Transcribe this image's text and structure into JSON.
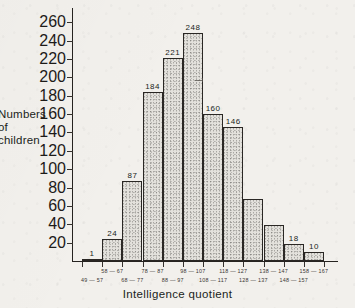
{
  "figure": {
    "y_axis_title": "Numbers\nof\nchildren",
    "y_axis_title_lines": [
      "Numbers",
      "of",
      "children"
    ],
    "x_axis_title": "Intelligence quotient"
  },
  "chart_data": {
    "type": "bar",
    "title": "",
    "xlabel": "Intelligence quotient",
    "ylabel": "Numbers of children",
    "ylim": [
      0,
      270
    ],
    "yticks": [
      20,
      40,
      60,
      80,
      100,
      120,
      140,
      160,
      180,
      200,
      220,
      240,
      260
    ],
    "grid": false,
    "legend": null,
    "categories": [
      "49 — 57",
      "58 — 67",
      "68 — 77",
      "78 — 87",
      "88 — 97",
      "98 — 107",
      "108 — 117",
      "118 — 127",
      "128 — 137",
      "138 — 147",
      "148 — 157",
      "158 — 167"
    ],
    "values": [
      1,
      24,
      87,
      184,
      221,
      248,
      160,
      146,
      68,
      39,
      18,
      10
    ],
    "bar_labels": [
      "1",
      "24",
      "87",
      "184",
      "221",
      "248",
      "160",
      "146",
      "",
      "",
      "18",
      "10"
    ],
    "bin_label_rows": [
      {
        "row": "bottom",
        "index": 0,
        "text": "49 — 57"
      },
      {
        "row": "top",
        "index": 1,
        "text": "58 — 67"
      },
      {
        "row": "bottom",
        "index": 2,
        "text": "68 — 77"
      },
      {
        "row": "top",
        "index": 3,
        "text": "78 — 87"
      },
      {
        "row": "bottom",
        "index": 4,
        "text": "88 — 97"
      },
      {
        "row": "top",
        "index": 5,
        "text": "98 — 107"
      },
      {
        "row": "bottom",
        "index": 6,
        "text": "108 — 117"
      },
      {
        "row": "top",
        "index": 7,
        "text": "118 — 127"
      },
      {
        "row": "bottom",
        "index": 8,
        "text": "128 — 137"
      },
      {
        "row": "top",
        "index": 9,
        "text": "138 — 147"
      },
      {
        "row": "bottom",
        "index": 10,
        "text": "148 — 157"
      },
      {
        "row": "top",
        "index": 11,
        "text": "158 — 167"
      }
    ],
    "colors": {
      "bar_fill": "#e3e1dc",
      "bar_edge": "#2a2724",
      "axis": "#262320",
      "text": "#201e1b",
      "background": "#f2f0ec"
    }
  }
}
